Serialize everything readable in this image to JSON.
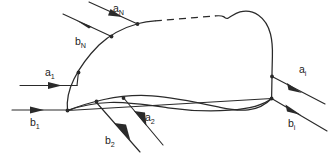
{
  "figure": {
    "type": "flux-boundary-diagram",
    "background_color": "#ffffff",
    "line_color": "#2a2a2a",
    "label_color": "#1c1c1c"
  },
  "boundary": {
    "name": "control-volume-boundary",
    "solid_segments": 2,
    "dashed_segment": {
      "present": true,
      "x_start": 155,
      "x_end": 215,
      "meaning": "unspecified-continued-boundary"
    },
    "interior_fold_line": true
  },
  "fluxes": [
    {
      "id": "a-N",
      "symbol": "a",
      "subscript": "N",
      "label": "aN",
      "direction": "inflow",
      "side": "top-left",
      "arrow_points": "toward-boundary"
    },
    {
      "id": "b-N",
      "symbol": "b",
      "subscript": "N",
      "label": "bN",
      "direction": "outflow",
      "side": "top-left",
      "arrow_points": "away-from-boundary"
    },
    {
      "id": "a-1",
      "symbol": "a",
      "subscript": "1",
      "label": "a1",
      "direction": "inflow",
      "side": "left",
      "arrow_points": "toward-boundary"
    },
    {
      "id": "b-1",
      "symbol": "b",
      "subscript": "1",
      "label": "b1",
      "direction": "outflow",
      "side": "left",
      "arrow_points": "away-from-boundary"
    },
    {
      "id": "a-2",
      "symbol": "a",
      "subscript": "2",
      "label": "a2",
      "direction": "inflow",
      "side": "bottom",
      "arrow_points": "toward-boundary"
    },
    {
      "id": "b-2",
      "symbol": "b",
      "subscript": "2",
      "label": "b2",
      "direction": "outflow",
      "side": "bottom",
      "arrow_points": "away-from-boundary"
    },
    {
      "id": "a-i",
      "symbol": "a",
      "subscript": "i",
      "label": "ai",
      "direction": "inflow",
      "side": "right",
      "arrow_points": "toward-boundary"
    },
    {
      "id": "b-i",
      "symbol": "b",
      "subscript": "i",
      "label": "bi",
      "direction": "inflow",
      "side": "right",
      "arrow_points": "toward-boundary"
    }
  ],
  "labels": {
    "a_N": {
      "base": "a",
      "sub": "N"
    },
    "b_N": {
      "base": "b",
      "sub": "N"
    },
    "a_1": {
      "base": "a",
      "sub": "1"
    },
    "b_1": {
      "base": "b",
      "sub": "1"
    },
    "a_2": {
      "base": "a",
      "sub": "2"
    },
    "b_2": {
      "base": "b",
      "sub": "2"
    },
    "a_i": {
      "base": "a",
      "sub": "i"
    },
    "b_i": {
      "base": "b",
      "sub": "i"
    }
  }
}
